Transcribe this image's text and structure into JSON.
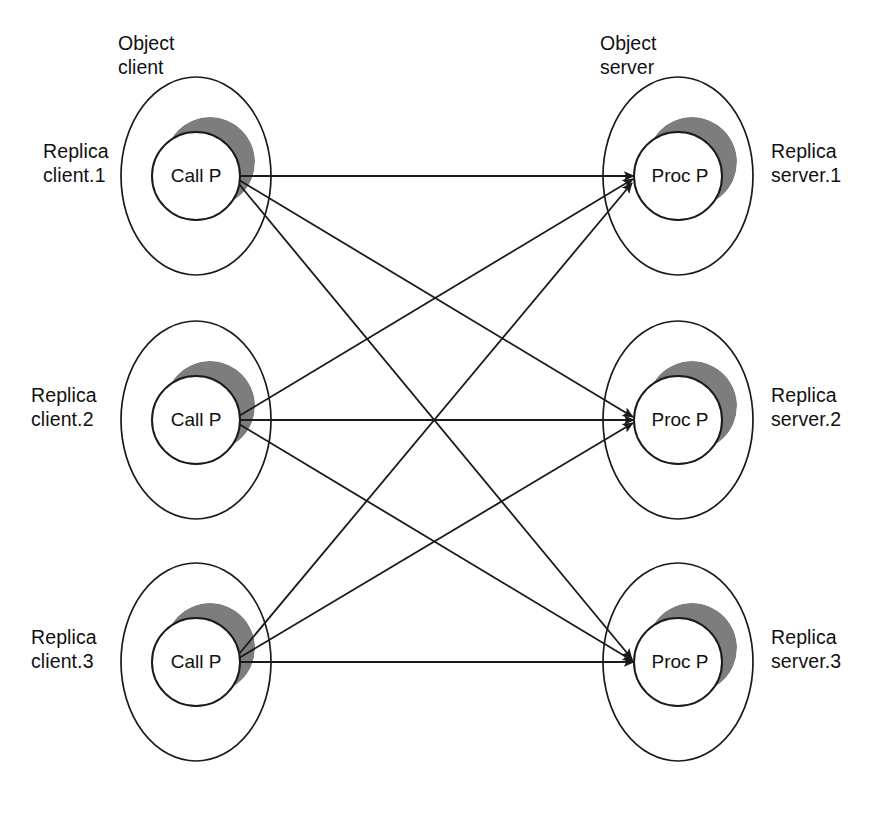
{
  "diagram": {
    "title_client": "Object\nclient",
    "title_server": "Object\nserver",
    "client_node_label": "Call P",
    "server_node_label": "Proc P",
    "ink_color": "#1a1a1a",
    "crescent_color": "#7d7d7d",
    "background_color": "#ffffff",
    "arrow_count": 9,
    "topology": "full bipartite 3x3",
    "clients": [
      {
        "id": "client-1",
        "replica_label": "Replica\nclient.1",
        "node_label": "Call P",
        "row": 1
      },
      {
        "id": "client-2",
        "replica_label": "Replica\nclient.2",
        "node_label": "Call P",
        "row": 2
      },
      {
        "id": "client-3",
        "replica_label": "Replica\nclient.3",
        "node_label": "Call P",
        "row": 3
      }
    ],
    "servers": [
      {
        "id": "server-1",
        "replica_label": "Replica\nserver.1",
        "node_label": "Proc P",
        "row": 1
      },
      {
        "id": "server-2",
        "replica_label": "Replica\nserver.2",
        "node_label": "Proc P",
        "row": 2
      },
      {
        "id": "server-3",
        "replica_label": "Replica\nserver.3",
        "node_label": "Proc P",
        "row": 3
      }
    ],
    "edges": [
      {
        "from": "client-1",
        "to": "server-1"
      },
      {
        "from": "client-1",
        "to": "server-2"
      },
      {
        "from": "client-1",
        "to": "server-3"
      },
      {
        "from": "client-2",
        "to": "server-1"
      },
      {
        "from": "client-2",
        "to": "server-2"
      },
      {
        "from": "client-2",
        "to": "server-3"
      },
      {
        "from": "client-3",
        "to": "server-1"
      },
      {
        "from": "client-3",
        "to": "server-2"
      },
      {
        "from": "client-3",
        "to": "server-3"
      }
    ]
  }
}
